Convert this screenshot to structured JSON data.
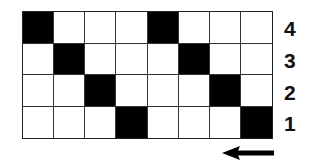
{
  "diagram": {
    "columns": 8,
    "rows": [
      {
        "label": "4",
        "filled": [
          1,
          5
        ]
      },
      {
        "label": "3",
        "filled": [
          2,
          6
        ]
      },
      {
        "label": "2",
        "filled": [
          3,
          7
        ]
      },
      {
        "label": "1",
        "filled": [
          4,
          8
        ]
      }
    ],
    "arrow_direction": "left",
    "colors": {
      "filled": "#000000",
      "empty": "#ffffff",
      "grid": "#333333"
    }
  }
}
